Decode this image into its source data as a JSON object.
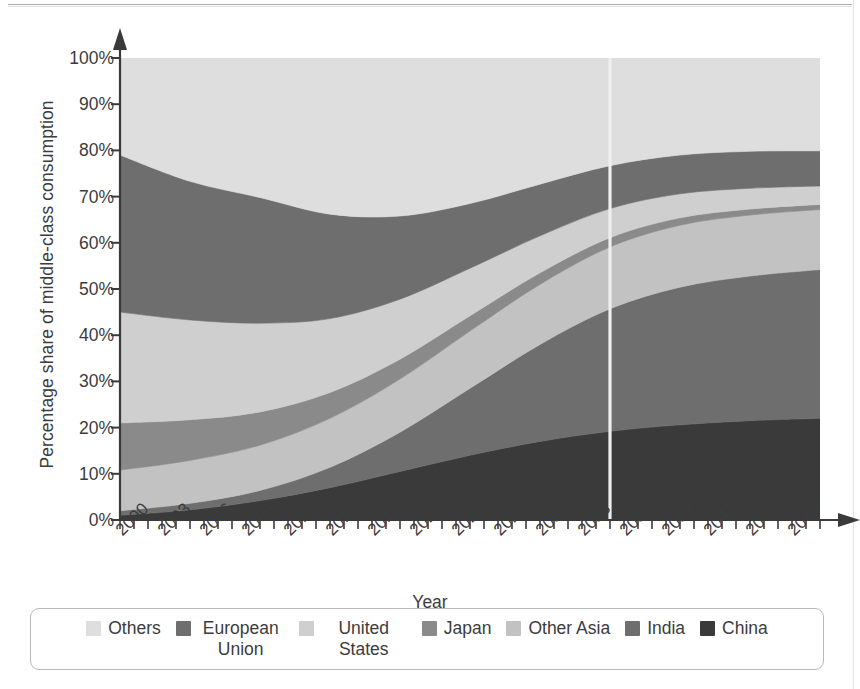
{
  "chart_data": {
    "type": "area",
    "stacked": true,
    "title": "",
    "xlabel": "Year",
    "ylabel": "Percentage share of middle-class consumption",
    "xlim": [
      2000,
      2050
    ],
    "ylim": [
      0,
      100
    ],
    "grid": false,
    "legend_position": "bottom",
    "x": [
      2000,
      2005,
      2010,
      2015,
      2020,
      2025,
      2030,
      2035,
      2040,
      2045,
      2050
    ],
    "x_tick_labels": [
      "2000",
      "2003",
      "2006",
      "2009",
      "2012",
      "2015",
      "2018",
      "2021",
      "2024",
      "2027",
      "2030",
      "2033",
      "2036",
      "2039",
      "2042",
      "2045",
      "2048"
    ],
    "x_tick_values": [
      2000,
      2003,
      2006,
      2009,
      2012,
      2015,
      2018,
      2021,
      2024,
      2027,
      2030,
      2033,
      2036,
      2039,
      2042,
      2045,
      2048
    ],
    "x_minor_tick_step": 1,
    "y_tick_labels": [
      "0%",
      "10%",
      "20%",
      "30%",
      "40%",
      "50%",
      "60%",
      "70%",
      "80%",
      "90%",
      "100%"
    ],
    "y_tick_values": [
      0,
      10,
      20,
      30,
      40,
      50,
      60,
      70,
      80,
      90,
      100
    ],
    "stack_order_bottom_to_top": [
      "China",
      "India",
      "Other Asia",
      "Japan",
      "United States",
      "European Union",
      "Others"
    ],
    "series": [
      {
        "name": "China",
        "color": "#3a3a3a",
        "values": [
          1.0,
          2.2,
          4.2,
          7.0,
          10.5,
          14.0,
          17.0,
          19.2,
          20.6,
          21.5,
          22.0
        ]
      },
      {
        "name": "India",
        "color": "#6e6e6e",
        "values": [
          1.0,
          1.4,
          2.2,
          4.4,
          8.5,
          14.5,
          21.0,
          26.5,
          29.8,
          31.3,
          32.2
        ]
      },
      {
        "name": "Other Asia",
        "color": "#c2c2c2",
        "values": [
          8.8,
          9.3,
          9.8,
          10.6,
          11.5,
          12.4,
          13.0,
          13.4,
          13.4,
          13.2,
          13.0
        ]
      },
      {
        "name": "Japan",
        "color": "#8a8a8a",
        "values": [
          10.2,
          8.8,
          7.2,
          5.6,
          4.3,
          3.3,
          2.5,
          2.0,
          1.6,
          1.3,
          1.1
        ]
      },
      {
        "name": "United States",
        "color": "#cfcfcf",
        "values": [
          24.0,
          21.6,
          19.2,
          16.0,
          13.0,
          10.3,
          8.0,
          6.3,
          5.2,
          4.5,
          4.0
        ]
      },
      {
        "name": "European Union",
        "color": "#6e6e6e",
        "values": [
          34.0,
          30.0,
          27.2,
          22.6,
          18.0,
          14.0,
          11.2,
          9.3,
          8.4,
          8.0,
          7.6
        ]
      },
      {
        "name": "Others",
        "color": "#dedede",
        "values": [
          21.0,
          26.7,
          30.2,
          33.8,
          34.2,
          31.5,
          27.3,
          23.3,
          21.0,
          20.2,
          20.1
        ]
      }
    ],
    "annotations": [
      {
        "type": "vertical-line",
        "x": 2035,
        "color": "#efefef",
        "label": ""
      }
    ]
  },
  "axes": {
    "y_axis_title": "Percentage share of middle-class consumption",
    "x_axis_title": "Year"
  },
  "legend": {
    "items": [
      {
        "label": "Others",
        "color": "#dedede",
        "wrap": false
      },
      {
        "label": "European Union",
        "color": "#6e6e6e",
        "wrap": true
      },
      {
        "label": "United States",
        "color": "#cfcfcf",
        "wrap": true
      },
      {
        "label": "Japan",
        "color": "#8a8a8a",
        "wrap": false
      },
      {
        "label": "Other Asia",
        "color": "#c2c2c2",
        "wrap": false
      },
      {
        "label": "India",
        "color": "#6e6e6e",
        "wrap": false
      },
      {
        "label": "China",
        "color": "#3a3a3a",
        "wrap": false
      }
    ]
  },
  "colors": {
    "axis": "#3a3a3a",
    "text": "#3c3c3c",
    "legend_border": "#b9b9b9",
    "divider": "#efefef",
    "background": "#ffffff"
  }
}
